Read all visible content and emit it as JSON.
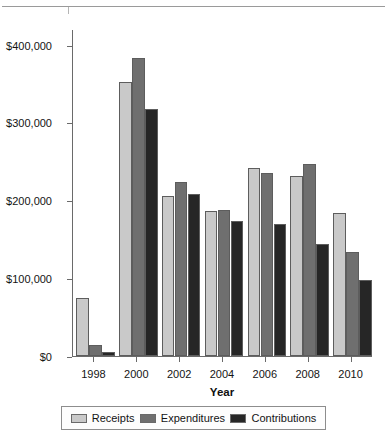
{
  "chart_data": {
    "type": "bar",
    "title": "",
    "xlabel": "Year",
    "ylabel": "",
    "categories": [
      "1998",
      "2000",
      "2002",
      "2004",
      "2006",
      "2008",
      "2010"
    ],
    "series": [
      {
        "name": "Receipts",
        "color": "#c9c9c9",
        "values": [
          75000,
          352000,
          206000,
          186000,
          242000,
          231000,
          184000
        ]
      },
      {
        "name": "Expenditures",
        "color": "#6f6f6f",
        "values": [
          14000,
          383000,
          223000,
          188000,
          235000,
          247000,
          134000
        ]
      },
      {
        "name": "Contributions",
        "color": "#262626",
        "values": [
          5000,
          317000,
          208000,
          174000,
          170000,
          144000,
          98000
        ]
      }
    ],
    "ylim": [
      0,
      420000
    ],
    "yticks": [
      0,
      100000,
      200000,
      300000,
      400000
    ],
    "ytick_labels": [
      "$0",
      "$100,000",
      "$200,000",
      "$300,000",
      "$400,000"
    ],
    "grid": false,
    "legend_position": "bottom"
  },
  "axes": {
    "x_title": "Year"
  },
  "legend": {
    "entries": [
      {
        "label": "Receipts",
        "swatch": "#c9c9c9"
      },
      {
        "label": "Expenditures",
        "swatch": "#6f6f6f"
      },
      {
        "label": "Contributions",
        "swatch": "#262626"
      }
    ]
  }
}
